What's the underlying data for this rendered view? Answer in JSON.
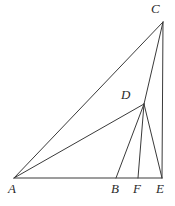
{
  "figure": {
    "type": "geometry-diagram",
    "background_color": "#ffffff",
    "stroke_color": "#3a3a3a",
    "label_color": "#2b2b2b",
    "stroke_width": 1,
    "canvas": {
      "width": 175,
      "height": 206
    },
    "points": [
      {
        "id": "A",
        "label": "A",
        "x": 14,
        "y": 178,
        "label_x": 8,
        "label_y": 182
      },
      {
        "id": "B",
        "label": "B",
        "x": 116,
        "y": 178,
        "label_x": 111,
        "label_y": 182
      },
      {
        "id": "F",
        "label": "F",
        "x": 138,
        "y": 178,
        "label_x": 133,
        "label_y": 182
      },
      {
        "id": "E",
        "label": "E",
        "x": 162,
        "y": 178,
        "label_x": 156,
        "label_y": 182
      },
      {
        "id": "D",
        "label": "D",
        "x": 144,
        "y": 104,
        "label_x": 121,
        "label_y": 88
      },
      {
        "id": "C",
        "label": "C",
        "x": 163,
        "y": 22,
        "label_x": 151,
        "label_y": 2
      }
    ],
    "segments": [
      {
        "id": "AE",
        "from": "A",
        "to": "E",
        "name": "baseline-a-e"
      },
      {
        "id": "AC",
        "from": "A",
        "to": "C",
        "name": "segment-a-c"
      },
      {
        "id": "AD",
        "from": "A",
        "to": "D",
        "name": "segment-a-d"
      },
      {
        "id": "CE",
        "from": "C",
        "to": "E",
        "name": "segment-c-e"
      },
      {
        "id": "CD",
        "from": "C",
        "to": "D",
        "name": "segment-c-d"
      },
      {
        "id": "DB",
        "from": "D",
        "to": "B",
        "name": "segment-d-b"
      },
      {
        "id": "DF",
        "from": "D",
        "to": "F",
        "name": "segment-d-f"
      },
      {
        "id": "DE",
        "from": "D",
        "to": "E",
        "name": "segment-d-e"
      }
    ]
  }
}
